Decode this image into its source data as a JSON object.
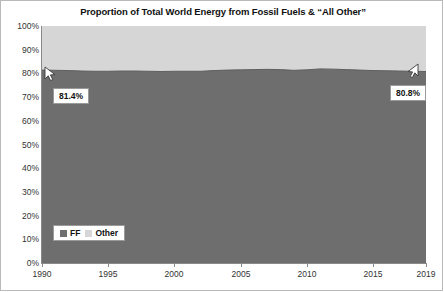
{
  "chart_data": {
    "type": "area",
    "title": "Proportion of Total World Energy from Fossil Fuels & “All Other”",
    "xlabel": "",
    "ylabel": "",
    "stacked": true,
    "percent_stacked": true,
    "grid": false,
    "legend_position": "bottom-left",
    "xlim": [
      1990,
      2019
    ],
    "ylim": [
      0,
      100
    ],
    "ytick_labels": [
      "100%",
      "90%",
      "80%",
      "70%",
      "60%",
      "50%",
      "40%",
      "30%",
      "20%",
      "10%",
      "0%"
    ],
    "ytick_values": [
      100,
      90,
      80,
      70,
      60,
      50,
      40,
      30,
      20,
      10,
      0
    ],
    "xtick_labels": [
      "1990",
      "1995",
      "2000",
      "2005",
      "2010",
      "2015",
      "2019"
    ],
    "xtick_values": [
      1990,
      1995,
      2000,
      2005,
      2010,
      2015,
      2019
    ],
    "x": [
      1990,
      1991,
      1992,
      1993,
      1994,
      1995,
      1996,
      1997,
      1998,
      1999,
      2000,
      2001,
      2002,
      2003,
      2004,
      2005,
      2006,
      2007,
      2008,
      2009,
      2010,
      2011,
      2012,
      2013,
      2014,
      2015,
      2016,
      2017,
      2018,
      2019
    ],
    "series": [
      {
        "name": "FF",
        "color": "#6e6e6e",
        "values": [
          81.4,
          81.3,
          81.2,
          81.0,
          80.9,
          80.9,
          81.0,
          81.0,
          80.9,
          80.8,
          80.9,
          80.9,
          80.9,
          81.2,
          81.4,
          81.5,
          81.6,
          81.7,
          81.6,
          81.3,
          81.5,
          81.9,
          81.8,
          81.6,
          81.4,
          81.2,
          81.1,
          81.0,
          80.9,
          80.8
        ],
        "endpoint_labels": {
          "first": "81.4%",
          "last": "80.8%"
        }
      },
      {
        "name": "Other",
        "color": "#d6d6d6",
        "values": [
          18.6,
          18.7,
          18.8,
          19.0,
          19.1,
          19.1,
          19.0,
          19.0,
          19.1,
          19.2,
          19.1,
          19.1,
          19.1,
          18.8,
          18.6,
          18.5,
          18.4,
          18.3,
          18.4,
          18.7,
          18.5,
          18.1,
          18.2,
          18.4,
          18.6,
          18.8,
          18.9,
          19.0,
          19.1,
          19.2
        ]
      }
    ],
    "annotations": [
      {
        "label": "81.4%",
        "target_year": 1990,
        "target_value": 81.4,
        "pointer": "arrow-up-left"
      },
      {
        "label": "80.8%",
        "target_year": 2019,
        "target_value": 80.8,
        "pointer": "arrow-up-right"
      }
    ],
    "legend": [
      {
        "label": "FF",
        "color": "#6e6e6e"
      },
      {
        "label": "Other",
        "color": "#d6d6d6"
      }
    ]
  }
}
